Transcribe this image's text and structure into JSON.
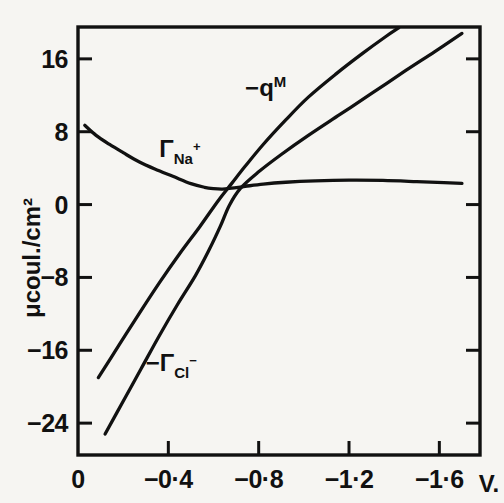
{
  "chart_data": {
    "type": "line",
    "title": "",
    "xlabel": "V.",
    "ylabel": "μcoul./cm²",
    "xlim": [
      0,
      -1.78
    ],
    "ylim": [
      -27.5,
      19.5
    ],
    "grid": false,
    "legend_position": "inline-annotations",
    "x_ticks": [
      0,
      -0.4,
      -0.8,
      -1.2,
      -1.6
    ],
    "x_tick_labels": [
      "0",
      "−0·4",
      "−0·8",
      "−1·2",
      "−1·6"
    ],
    "y_ticks": [
      16,
      8,
      0,
      -8,
      -16,
      -24
    ],
    "y_tick_labels": [
      "16",
      "8",
      "0",
      "−8",
      "−16",
      "−24"
    ],
    "series": [
      {
        "name": "Γ_Na+",
        "label_text": "Γ",
        "label_sub": "Na",
        "label_sup": "+",
        "points": [
          [
            -0.03,
            8.7
          ],
          [
            -0.08,
            7.6
          ],
          [
            -0.14,
            6.6
          ],
          [
            -0.2,
            5.7
          ],
          [
            -0.27,
            4.7
          ],
          [
            -0.34,
            3.9
          ],
          [
            -0.42,
            3.1
          ],
          [
            -0.5,
            2.3
          ],
          [
            -0.56,
            1.9
          ],
          [
            -0.6,
            1.75
          ],
          [
            -0.64,
            1.7
          ],
          [
            -0.68,
            1.8
          ],
          [
            -0.74,
            2.0
          ],
          [
            -0.82,
            2.25
          ],
          [
            -0.92,
            2.45
          ],
          [
            -1.05,
            2.6
          ],
          [
            -1.2,
            2.68
          ],
          [
            -1.35,
            2.65
          ],
          [
            -1.5,
            2.52
          ],
          [
            -1.62,
            2.4
          ],
          [
            -1.7,
            2.32
          ]
        ]
      },
      {
        "name": "-q_M",
        "label_text": "−q",
        "label_sup": "M",
        "points": [
          [
            -0.09,
            -19.0
          ],
          [
            -0.18,
            -15.5
          ],
          [
            -0.27,
            -12.0
          ],
          [
            -0.36,
            -8.6
          ],
          [
            -0.45,
            -5.4
          ],
          [
            -0.54,
            -2.4
          ],
          [
            -0.62,
            0.4
          ],
          [
            -0.68,
            2.3
          ],
          [
            -0.74,
            4.2
          ],
          [
            -0.82,
            6.6
          ],
          [
            -0.92,
            9.3
          ],
          [
            -1.02,
            11.8
          ],
          [
            -1.14,
            14.3
          ],
          [
            -1.26,
            16.6
          ],
          [
            -1.36,
            18.4
          ],
          [
            -1.42,
            19.4
          ]
        ]
      },
      {
        "name": "-Γ_Cl-",
        "label_text": "−Γ",
        "label_sub": "Cl",
        "label_sup": "−",
        "points": [
          [
            -0.12,
            -25.2
          ],
          [
            -0.2,
            -21.6
          ],
          [
            -0.28,
            -18.0
          ],
          [
            -0.36,
            -14.4
          ],
          [
            -0.44,
            -11.0
          ],
          [
            -0.52,
            -7.8
          ],
          [
            -0.58,
            -5.0
          ],
          [
            -0.63,
            -2.4
          ],
          [
            -0.67,
            -0.1
          ],
          [
            -0.72,
            1.8
          ],
          [
            -0.8,
            3.6
          ],
          [
            -0.9,
            5.5
          ],
          [
            -1.02,
            7.6
          ],
          [
            -1.16,
            9.9
          ],
          [
            -1.3,
            12.2
          ],
          [
            -1.45,
            14.7
          ],
          [
            -1.58,
            16.8
          ],
          [
            -1.7,
            18.8
          ]
        ]
      }
    ],
    "annotations": [
      {
        "name": "gamma-na-label",
        "x": -0.36,
        "y": 5.2
      },
      {
        "name": "minus-qm-label",
        "x": -0.74,
        "y": 11.9
      },
      {
        "name": "minus-gamma-cl-label",
        "x": -0.3,
        "y": -18.3
      }
    ]
  },
  "axes": {
    "y_axis_label": "μcoul./cm²",
    "x_axis_unit": "V."
  }
}
